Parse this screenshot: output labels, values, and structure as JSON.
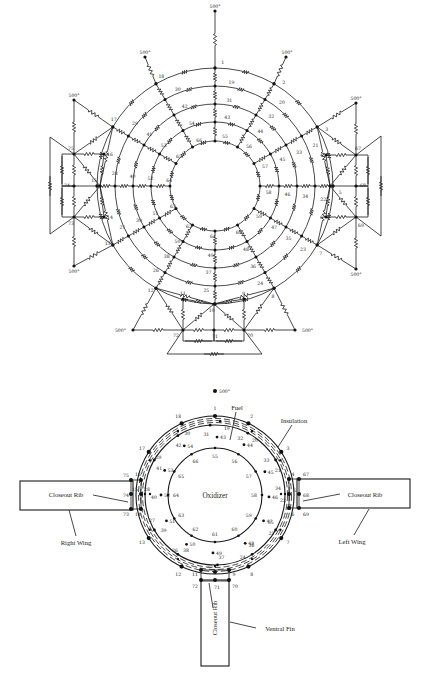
{
  "figure": {
    "top_network": {
      "title": "Thermal resistance network",
      "center": [
        215,
        186
      ],
      "rings": [
        {
          "radius": 118,
          "nodes": [
            1,
            2,
            3,
            4,
            5,
            6,
            7,
            8,
            9,
            10,
            11,
            12,
            13,
            14,
            15,
            16,
            17,
            18
          ],
          "note": "outer skin ring"
        },
        {
          "radius": 100,
          "nodes": [
            19,
            20,
            21,
            22,
            23,
            24,
            25,
            26,
            27,
            28,
            29,
            30
          ]
        },
        {
          "radius": 82,
          "nodes": [
            31,
            32,
            33,
            34,
            35,
            36,
            37,
            38,
            39,
            40,
            41,
            42
          ]
        },
        {
          "radius": 64,
          "nodes": [
            43,
            44,
            45,
            46,
            47,
            48,
            49,
            50,
            51,
            52,
            53,
            54
          ]
        },
        {
          "radius": 45,
          "nodes": [
            55,
            56,
            57,
            58,
            59,
            60,
            61,
            62,
            63,
            64,
            65,
            66
          ]
        }
      ],
      "outer_ring_labels": {
        "1": "1",
        "2": "2",
        "3": "3",
        "4": "4",
        "5": "5",
        "6": "6",
        "7": "7",
        "8": "8",
        "9": "9",
        "10": "10",
        "11": "11",
        "12": "12",
        "13": "13",
        "14": "14",
        "15": "15",
        "16": "16",
        "17": "17",
        "18": "18"
      },
      "boundary_label": "500°",
      "boundary_nodes": [
        {
          "id": "b-top",
          "pos": [
            215,
            11
          ]
        },
        {
          "id": "b-top-left",
          "pos": [
            145,
            57
          ]
        },
        {
          "id": "b-top-right",
          "pos": [
            286,
            57
          ]
        },
        {
          "id": "b-left-top",
          "pos": [
            74,
            100
          ]
        },
        {
          "id": "b-right-top",
          "pos": [
            356,
            103
          ]
        },
        {
          "id": "b-left-bottom",
          "pos": [
            74,
            266
          ]
        },
        {
          "id": "b-right-bottom",
          "pos": [
            356,
            269
          ]
        },
        {
          "id": "b-bottom-left",
          "pos": [
            133,
            330
          ]
        },
        {
          "id": "b-bottom-right",
          "pos": [
            295,
            330
          ]
        }
      ],
      "wing_nodes": {
        "right_wing": [
          {
            "id": "75",
            "pos": [
              74,
              154
            ]
          },
          {
            "id": "74",
            "pos": [
              74,
              186
            ]
          },
          {
            "id": "73",
            "pos": [
              74,
              217
            ]
          }
        ],
        "left_wing": [
          {
            "id": "67",
            "pos": [
              356,
              155
            ]
          },
          {
            "id": "68",
            "pos": [
              356,
              186
            ]
          },
          {
            "id": "69",
            "pos": [
              356,
              217
            ]
          }
        ],
        "ventral_fin": [
          {
            "id": "72",
            "pos": [
              183,
              330
            ]
          },
          {
            "id": "71",
            "pos": [
              214,
              330
            ]
          },
          {
            "id": "70",
            "pos": [
              244,
              330
            ]
          }
        ]
      },
      "side_nodes": {
        "16": [
          104,
          154
        ],
        "15": [
          100,
          186
        ],
        "14": [
          104,
          217
        ],
        "4": [
          326,
          155
        ],
        "5": [
          330,
          186
        ],
        "6": [
          326,
          217
        ],
        "11": [
          183,
          299
        ],
        "10": [
          214,
          304
        ],
        "9": [
          244,
          299
        ]
      }
    },
    "bottom_section": {
      "title": "Tank cross-section",
      "center": [
        215,
        495
      ],
      "boundary_label": "500°",
      "regions": {
        "fuel": "Fuel",
        "insulation": "Insulation",
        "oxidizer": "Oxidizer",
        "closeout_rib_right": "Closeout Rib",
        "closeout_rib_left": "Closeout Rib",
        "closeout_rib_fin": "Closeout Rib",
        "right_wing": "Right Wing",
        "left_wing": "Left Wing",
        "ventral_fin": "Ventral Fin"
      }
    }
  }
}
